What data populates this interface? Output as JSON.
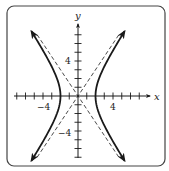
{
  "chart_data": {
    "type": "line",
    "title": "",
    "xlabel": "x",
    "ylabel": "y",
    "xlim": [
      -7,
      8
    ],
    "ylim": [
      -7,
      8
    ],
    "x_tick_labels": [
      {
        "value": -4,
        "label": "−4"
      },
      {
        "value": 4,
        "label": "4"
      }
    ],
    "y_tick_labels": [
      {
        "value": 4,
        "label": "4"
      },
      {
        "value": -4,
        "label": "−4"
      }
    ],
    "ticks": {
      "x": [
        -7,
        -6,
        -5,
        -4,
        -3,
        -2,
        -1,
        1,
        2,
        3,
        4,
        5,
        6,
        7
      ],
      "y": [
        -7,
        -6,
        -5,
        -4,
        -3,
        -2,
        -1,
        1,
        2,
        3,
        4,
        5,
        6,
        7
      ]
    },
    "grid": false,
    "legend": null,
    "series": [
      {
        "name": "hyperbola",
        "equation": "x^2/4 - y^2/9 = 1",
        "style": "solid",
        "branches": [
          {
            "points": [
              [
                -5.3,
                7.4
              ],
              [
                -4.47,
                6
              ],
              [
                -3.61,
                4.5
              ],
              [
                -2.83,
                3
              ],
              [
                -2.24,
                1.5
              ],
              [
                -2,
                0
              ],
              [
                -2.24,
                -1.5
              ],
              [
                -2.83,
                -3
              ],
              [
                -3.61,
                -4.5
              ],
              [
                -4.47,
                -6
              ],
              [
                -5.3,
                -7.4
              ]
            ]
          },
          {
            "points": [
              [
                5.3,
                7.4
              ],
              [
                4.47,
                6
              ],
              [
                3.61,
                4.5
              ],
              [
                2.83,
                3
              ],
              [
                2.24,
                1.5
              ],
              [
                2,
                0
              ],
              [
                2.24,
                -1.5
              ],
              [
                2.83,
                -3
              ],
              [
                3.61,
                -4.5
              ],
              [
                4.47,
                -6
              ],
              [
                5.3,
                -7.4
              ]
            ]
          }
        ],
        "arrows_at_ends": true,
        "vertices": [
          [
            -2,
            0
          ],
          [
            2,
            0
          ]
        ]
      },
      {
        "name": "asymptote-1",
        "equation": "y = 1.5x",
        "style": "dashed",
        "points": [
          [
            -4.67,
            -7
          ],
          [
            4.67,
            7
          ]
        ]
      },
      {
        "name": "asymptote-2",
        "equation": "y = -1.5x",
        "style": "dashed",
        "points": [
          [
            -4.67,
            7
          ],
          [
            4.67,
            -7
          ]
        ]
      }
    ],
    "frame": {
      "rounded_border": true
    }
  },
  "layout": {
    "origin_px": [
      78,
      96
    ],
    "unit_px": 8.75,
    "colors": {
      "ink": "#1a1a1a",
      "border": "#444444",
      "background": "#ffffff"
    }
  }
}
